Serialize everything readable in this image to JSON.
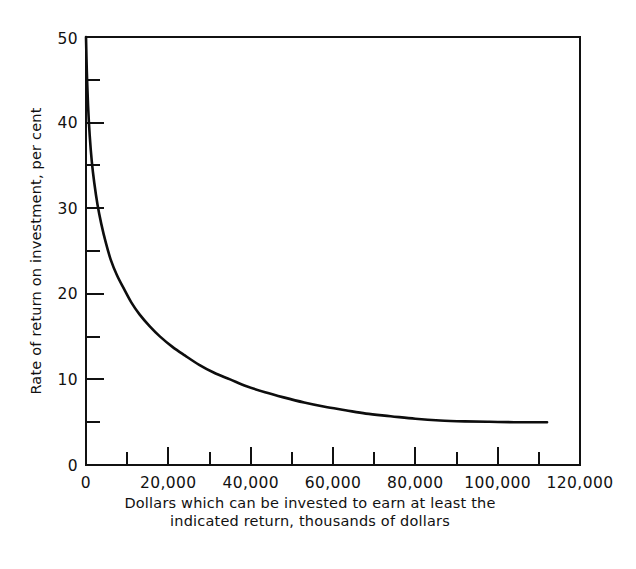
{
  "chart_data": {
    "type": "line",
    "title": "",
    "subtitle": "",
    "xlabel": "Dollars which can be invested to earn at least the indicated return, thousands of dollars",
    "xlabel_line1": "Dollars which can be invested to earn at least the",
    "xlabel_line2": "indicated return, thousands of dollars",
    "ylabel": "Rate of return on investment, per cent",
    "xlim": [
      0,
      120000
    ],
    "ylim": [
      0,
      50
    ],
    "grid": false,
    "legend": false,
    "legend_position": "none",
    "line_color": "#0d0d0d",
    "background_color": "#ffffff",
    "axis_color": "#111111",
    "x_major_ticks": [
      0,
      20000,
      40000,
      60000,
      80000,
      100000,
      120000
    ],
    "x_major_tick_labels": [
      "0",
      "20,000",
      "40,000",
      "60,000",
      "80,000",
      "100,000",
      "120,000"
    ],
    "x_minor_ticks": [
      10000,
      30000,
      50000,
      70000,
      90000,
      110000
    ],
    "y_major_ticks": [
      0,
      10,
      20,
      30,
      40,
      50
    ],
    "y_major_tick_labels": [
      "0",
      "10",
      "20",
      "30",
      "40",
      "50"
    ],
    "y_minor_ticks": [
      5,
      15,
      25,
      35,
      45
    ],
    "series": [
      {
        "name": "Rate of return on investment",
        "x": [
          0,
          200,
          500,
          900,
          1400,
          2000,
          2800,
          3700,
          4800,
          6000,
          7500,
          9200,
          11000,
          13000,
          15500,
          18000,
          21000,
          24000,
          27500,
          31000,
          35000,
          39000,
          43500,
          48000,
          53000,
          58000,
          63000,
          68000,
          74000,
          80000,
          86000,
          92000,
          98000,
          104000,
          108000,
          112000
        ],
        "values": [
          50.0,
          46.0,
          42.0,
          38.5,
          35.5,
          33.0,
          30.4,
          28.2,
          26.0,
          24.0,
          22.2,
          20.6,
          19.0,
          17.6,
          16.2,
          15.0,
          13.8,
          12.8,
          11.7,
          10.8,
          10.0,
          9.2,
          8.5,
          7.9,
          7.3,
          6.8,
          6.4,
          6.0,
          5.7,
          5.4,
          5.2,
          5.1,
          5.05,
          5.0,
          5.0,
          5.0
        ]
      }
    ],
    "annotations": []
  }
}
